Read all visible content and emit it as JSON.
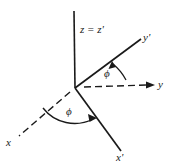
{
  "figure": {
    "background_color": "#ffffff",
    "line_color": "#1a1a1a",
    "labels": {
      "z_axis": "z = z'",
      "y_prime_axis": "y'",
      "y_axis": "y",
      "x_axis": "x",
      "x_prime_axis": "x'",
      "angle_upper": "ϕ",
      "angle_lower": "ϕ"
    },
    "axes": [
      {
        "name": "z = z'",
        "style": "solid",
        "from": [
          75,
          88
        ],
        "to": [
          74,
          11
        ],
        "arrow": false
      },
      {
        "name": "y'",
        "style": "solid",
        "from": [
          75,
          88
        ],
        "to": [
          141,
          39
        ],
        "arrow": false
      },
      {
        "name": "x'",
        "style": "solid",
        "from": [
          75,
          88
        ],
        "to": [
          121,
          151
        ],
        "arrow": false
      },
      {
        "name": "y",
        "style": "dashed",
        "from": [
          75,
          88
        ],
        "to": [
          154,
          85
        ],
        "arrow": true
      },
      {
        "name": "x",
        "style": "dashed",
        "from": [
          75,
          88
        ],
        "to": [
          17,
          137
        ],
        "arrow": false
      }
    ],
    "angles": [
      {
        "name": "phi-upper",
        "symbol": "ϕ",
        "between": [
          "y",
          "y'"
        ],
        "arrow_direction": "counterclockwise"
      },
      {
        "name": "phi-lower",
        "symbol": "ϕ",
        "between": [
          "x",
          "x'"
        ],
        "arrow_direction": "clockwise"
      }
    ]
  }
}
